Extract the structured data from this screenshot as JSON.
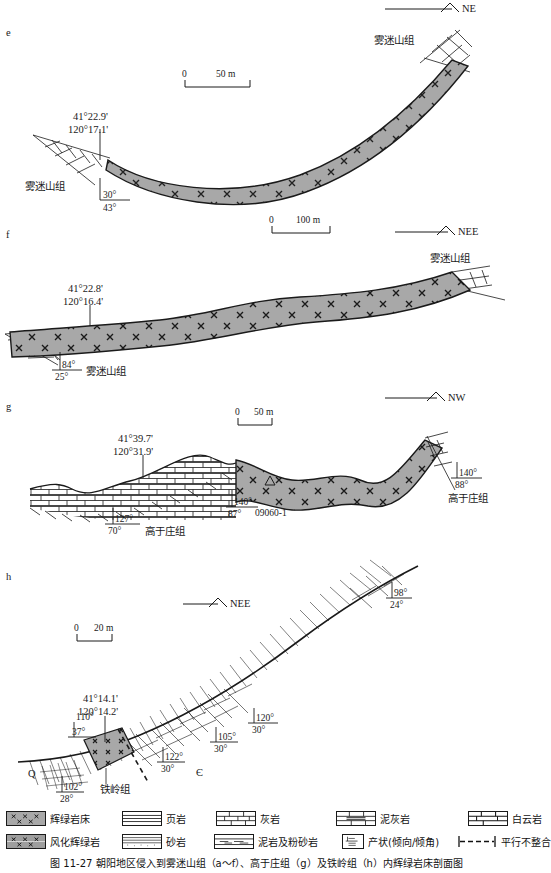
{
  "figure": {
    "caption": "图 11-27  朝阳地区侵入到雾迷山组（a～f）、高于庄组（g）及铁岭组（h）内辉绿岩床剖面图",
    "fill_color": "#a8a8a8",
    "line_color": "#1a1a1a"
  },
  "panels": [
    {
      "id": "e",
      "letter": "e",
      "compass": "NE",
      "scale": {
        "zero": "0",
        "value": "50 m"
      },
      "coords": {
        "lat": "41°22.9'",
        "lon": "120°17.1'"
      },
      "unit_labels": [
        "雾迷山组",
        "雾迷山组"
      ],
      "attitudes": [
        {
          "dip_dir": "30°",
          "dip": "43°"
        }
      ]
    },
    {
      "id": "f",
      "letter": "f",
      "compass": "NEE",
      "scale": {
        "zero": "0",
        "value": "100 m"
      },
      "coords": {
        "lat": "41°22.8'",
        "lon": "120°16.4'"
      },
      "unit_labels": [
        "雾迷山组",
        "雾迷山组"
      ],
      "attitudes": [
        {
          "dip_dir": "84°",
          "dip": "25°"
        }
      ]
    },
    {
      "id": "g",
      "letter": "g",
      "compass": "NW",
      "scale": {
        "zero": "0",
        "value": "50 m"
      },
      "coords": {
        "lat": "41°39.7'",
        "lon": "120°31.9'"
      },
      "sample": "09060-1",
      "unit_labels": [
        "高于庄组",
        "高于庄组"
      ],
      "attitudes": [
        {
          "dip_dir": "127°",
          "dip": "70°"
        },
        {
          "dip_dir": "140°",
          "dip": "87°"
        },
        {
          "dip_dir": "140°",
          "dip": "88°"
        }
      ]
    },
    {
      "id": "h",
      "letter": "h",
      "compass": "NEE",
      "scale": {
        "zero": "0",
        "value": "20 m"
      },
      "coords": {
        "lat": "41°14.1'",
        "lon": "120°14.2'"
      },
      "unit_labels": [
        "铁岭组"
      ],
      "period_labels": [
        "Q",
        "Є"
      ],
      "attitudes": [
        {
          "dip_dir": "110°",
          "dip": "37°"
        },
        {
          "dip_dir": "102°",
          "dip": "28°"
        },
        {
          "dip_dir": "122°",
          "dip": "30°"
        },
        {
          "dip_dir": "105°",
          "dip": "30°"
        },
        {
          "dip_dir": "120°",
          "dip": "30°"
        },
        {
          "dip_dir": "98°",
          "dip": "24°"
        }
      ]
    }
  ],
  "legend": {
    "row1": [
      {
        "key": "diabase-sill",
        "label": "辉绿岩床",
        "icon": "diabase-swatch"
      },
      {
        "key": "shale",
        "label": "页岩",
        "icon": "shale-swatch"
      },
      {
        "key": "limestone",
        "label": "灰岩",
        "icon": "limestone-swatch"
      },
      {
        "key": "marl",
        "label": "泥灰岩",
        "icon": "marl-swatch"
      },
      {
        "key": "dolomite",
        "label": "白云岩",
        "icon": "dolomite-swatch"
      }
    ],
    "row2": [
      {
        "key": "weathered-diabase",
        "label": "风化辉绿岩",
        "icon": "weathered-diabase-swatch"
      },
      {
        "key": "sandstone",
        "label": "砂岩",
        "icon": "sandstone-swatch"
      },
      {
        "key": "mudstone-siltstone",
        "label": "泥岩及粉砂岩",
        "icon": "mudstone-swatch"
      },
      {
        "key": "attitude",
        "label": "产状(倾向/倾角)",
        "icon": "attitude-swatch"
      },
      {
        "key": "parallel-unconformity",
        "label": "平行不整合",
        "icon": "dashed-swatch"
      }
    ]
  }
}
